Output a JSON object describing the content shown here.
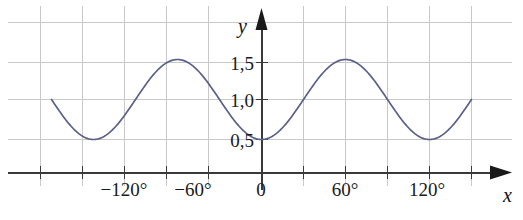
{
  "chart_data": {
    "type": "line",
    "title": "",
    "xlabel": "x",
    "ylabel": "y",
    "xlim": [
      -165,
      165
    ],
    "ylim": [
      -0.35,
      1.95
    ],
    "grid": true,
    "legend": null,
    "x_unit": "degrees",
    "x_tick_labels": [
      "−120°",
      "−60°",
      "0",
      "60°",
      "120°"
    ],
    "x_tick_values": [
      -120,
      -60,
      0,
      60,
      120
    ],
    "x_minor_tick_values": [
      -150,
      -90,
      -30,
      30,
      90,
      150
    ],
    "y_tick_labels": [
      "0,5",
      "1,0",
      "1,5"
    ],
    "y_tick_values": [
      0.5,
      1.0,
      1.5
    ],
    "gridline_y_values": [
      0.5,
      1.0,
      1.5,
      2.0
    ],
    "gridline_x_values": [
      -150,
      -120,
      -90,
      -60,
      -30,
      0,
      30,
      60,
      90,
      120,
      150
    ],
    "series": [
      {
        "name": "y = 1 − 0,5·cos(3x)",
        "color": "#5a6089",
        "x": [
          -150,
          -144,
          -138,
          -132,
          -126,
          -120,
          -114,
          -108,
          -102,
          -96,
          -90,
          -84,
          -78,
          -72,
          -66,
          -60,
          -54,
          -48,
          -42,
          -36,
          -30,
          -24,
          -18,
          -12,
          -6,
          0,
          6,
          12,
          18,
          24,
          30,
          36,
          42,
          48,
          54,
          60,
          66,
          72,
          78,
          84,
          90,
          96,
          102,
          108,
          114,
          120,
          126,
          132,
          138,
          144,
          150
        ],
        "values": [
          1.0,
          0.854,
          0.729,
          0.637,
          0.568,
          0.5,
          0.568,
          0.637,
          0.729,
          0.854,
          1.0,
          1.146,
          1.271,
          1.363,
          1.432,
          1.5,
          1.432,
          1.363,
          1.271,
          1.146,
          1.0,
          0.854,
          0.729,
          0.637,
          0.568,
          0.5,
          0.568,
          0.637,
          0.729,
          0.854,
          1.0,
          1.146,
          1.271,
          1.363,
          1.432,
          1.5,
          1.432,
          1.363,
          1.271,
          1.146,
          1.0,
          0.854,
          0.729,
          0.637,
          0.568,
          0.5,
          0.568,
          0.637,
          0.729,
          0.854,
          1.0
        ]
      }
    ],
    "maxima": [
      {
        "x": -60,
        "y": 1.5
      },
      {
        "x": 60,
        "y": 1.5
      }
    ],
    "minima": [
      {
        "x": -120,
        "y": 0.5
      },
      {
        "x": 0,
        "y": 0.5
      },
      {
        "x": 120,
        "y": 0.5
      }
    ],
    "period_degrees": 120,
    "amplitude": 0.5,
    "midline": 1.0,
    "colors": {
      "curve": "#5a6089",
      "grid": "#c8c8c8",
      "axis": "#333333",
      "text": "#1a1a1a",
      "background": "#ffffff"
    }
  },
  "axes": {
    "x_axis_label": "x",
    "y_axis_label": "y"
  },
  "x_ticks": [
    {
      "label": "−120°",
      "left": 124
    },
    {
      "label": "−60°",
      "left": 193
    },
    {
      "label": "0",
      "left": 261
    },
    {
      "label": "60°",
      "left": 345
    },
    {
      "label": "120°",
      "left": 427
    }
  ],
  "y_ticks": [
    {
      "label": "1,5",
      "top": 63
    },
    {
      "label": "1,0",
      "top": 100
    },
    {
      "label": "0,5",
      "top": 140
    }
  ]
}
